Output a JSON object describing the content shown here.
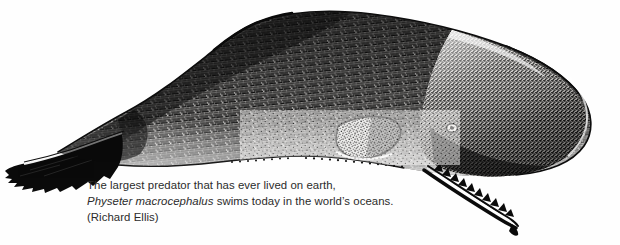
{
  "figure": {
    "background_color": "#fefefe",
    "ink_color": "#111111",
    "caption_color": "#2b2b2b"
  },
  "caption": {
    "line1": "The largest predator that has ever lived on earth,",
    "line2_species": "Physeter macrocephalus",
    "line2_rest": " swims today in the world’s oceans.",
    "line3": "(Richard Ellis)"
  },
  "artwork": {
    "subject": "sperm-whale",
    "orientation": "head-right",
    "technique": "pen-and-ink stipple engraving",
    "parts": [
      {
        "name": "tail-fluke",
        "label": "tail fluke"
      },
      {
        "name": "tail-stock",
        "label": "tail stock"
      },
      {
        "name": "dorsal-hump",
        "label": "dorsal hump"
      },
      {
        "name": "body",
        "label": "body"
      },
      {
        "name": "pectoral-flipper",
        "label": "pectoral flipper"
      },
      {
        "name": "eye",
        "label": "eye"
      },
      {
        "name": "head",
        "label": "blunt squared head"
      },
      {
        "name": "lower-jaw",
        "label": "toothed lower jaw"
      }
    ]
  }
}
